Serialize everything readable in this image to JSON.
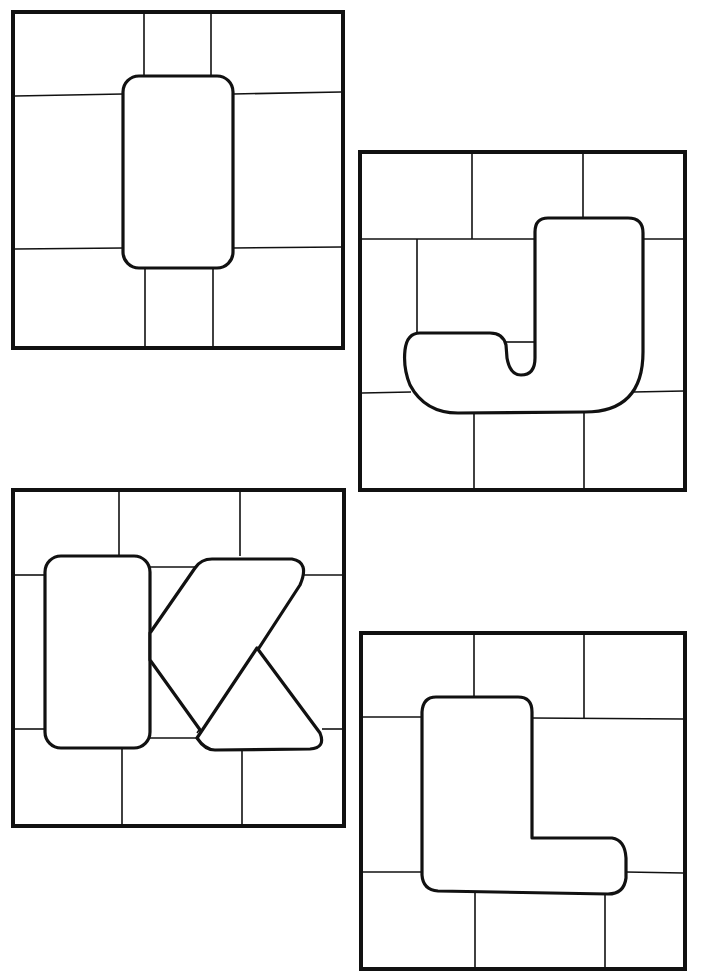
{
  "page": {
    "type": "stained-glass letter coloring page",
    "background": "#ffffff",
    "line_color": "#111111"
  },
  "panels": [
    {
      "letter": "I",
      "position": "top-left"
    },
    {
      "letter": "J",
      "position": "middle-right-top"
    },
    {
      "letter": "K",
      "position": "middle-left-bottom"
    },
    {
      "letter": "L",
      "position": "bottom-right"
    }
  ]
}
